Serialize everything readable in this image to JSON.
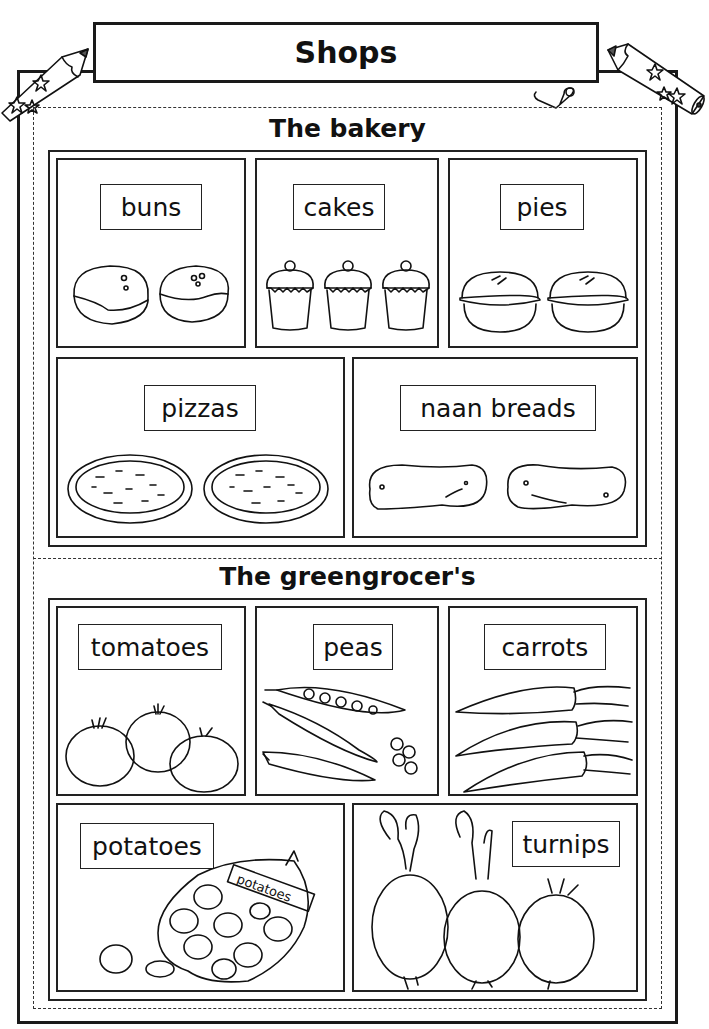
{
  "title": "Shops",
  "sections": [
    {
      "heading": "The bakery",
      "items": [
        {
          "label": "buns",
          "icon": "bun-icon"
        },
        {
          "label": "cakes",
          "icon": "cupcake-icon"
        },
        {
          "label": "pies",
          "icon": "pie-icon"
        },
        {
          "label": "pizzas",
          "icon": "pizza-icon"
        },
        {
          "label": "naan breads",
          "icon": "naan-bread-icon"
        }
      ]
    },
    {
      "heading": "The greengrocer's",
      "items": [
        {
          "label": "tomatoes",
          "icon": "tomato-icon"
        },
        {
          "label": "peas",
          "icon": "pea-pod-icon"
        },
        {
          "label": "carrots",
          "icon": "carrot-icon"
        },
        {
          "label": "potatoes",
          "icon": "potato-sack-icon"
        },
        {
          "label": "turnips",
          "icon": "turnip-icon"
        }
      ]
    }
  ],
  "sack_label": "potatoes",
  "decorations": [
    "star-pencil-icon-left",
    "star-pencil-icon-right",
    "paper-clip-icon"
  ]
}
